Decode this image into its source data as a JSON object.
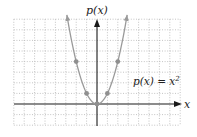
{
  "chart_data": {
    "type": "line",
    "title": "",
    "function_label": "p(x) = x²",
    "function_label_parts": {
      "lhs": "p(x) = x",
      "exp": "2"
    },
    "xlabel": "x",
    "ylabel": "p(x)",
    "xlim": [
      -8,
      8
    ],
    "ylim": [
      -2,
      8
    ],
    "grid": true,
    "grid_style": "dotted",
    "series": [
      {
        "name": "p(x) = x^2",
        "color": "#9a9a9a",
        "x": [
          -2.9,
          -2,
          -1,
          0,
          1,
          2,
          2.9
        ],
        "values": [
          8.4,
          4,
          1,
          0,
          1,
          4,
          8.4
        ]
      }
    ],
    "marked_points": [
      {
        "x": -2,
        "y": 4
      },
      {
        "x": -1,
        "y": 1
      },
      {
        "x": 0,
        "y": 0
      },
      {
        "x": 1,
        "y": 1
      },
      {
        "x": 2,
        "y": 4
      }
    ]
  },
  "colors": {
    "axis": "#1a1a1a",
    "grid": "#b5b5b5",
    "curve": "#9a9a9a",
    "point": "#8f8f8f"
  }
}
